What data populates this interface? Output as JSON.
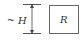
{
  "diagram": {
    "height_label": {
      "prefix": "~",
      "symbol": "H"
    },
    "box_label": "R",
    "colors": {
      "stroke": "#555555",
      "text": "#333333",
      "background": "#ffffff"
    }
  }
}
